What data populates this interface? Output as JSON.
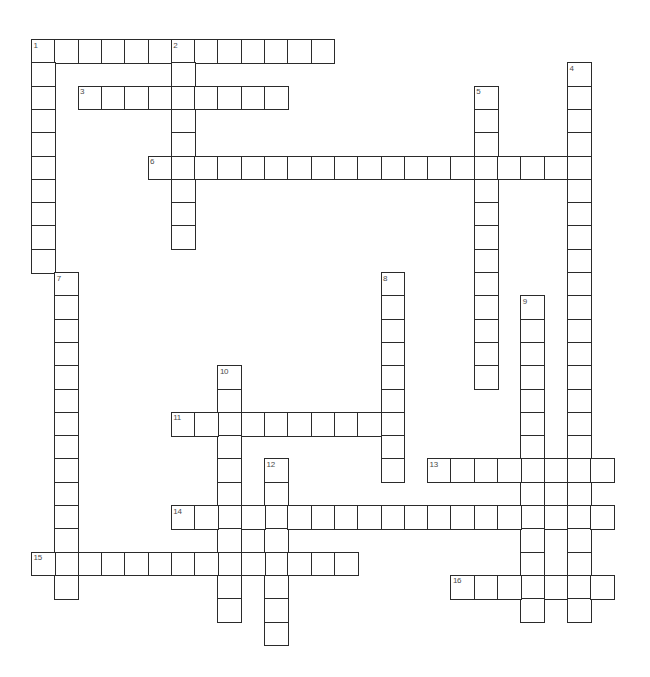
{
  "puzzle": {
    "type": "crossword-grid",
    "title": "",
    "grid_origin": {
      "x": 31,
      "y": 39
    },
    "cell_size": 23.3,
    "cell_fill": "#ffffff",
    "cell_border": "#2b2b2b",
    "number_color": "#4a4a4a",
    "background": "#ffffff",
    "entry_count": 16,
    "entries": [
      {
        "number": "1",
        "direction": "across",
        "row": 0,
        "col": 0,
        "length": 13
      },
      {
        "number": "1",
        "direction": "down",
        "row": 0,
        "col": 0,
        "length": 10
      },
      {
        "number": "2",
        "direction": "down",
        "row": 0,
        "col": 6,
        "length": 9
      },
      {
        "number": "3",
        "direction": "across",
        "row": 2,
        "col": 2,
        "length": 9
      },
      {
        "number": "4",
        "direction": "down",
        "row": 1,
        "col": 23,
        "length": 24
      },
      {
        "number": "5",
        "direction": "down",
        "row": 2,
        "col": 19,
        "length": 13
      },
      {
        "number": "6",
        "direction": "across",
        "row": 5,
        "col": 5,
        "length": 18
      },
      {
        "number": "7",
        "direction": "down",
        "row": 10,
        "col": 1,
        "length": 14
      },
      {
        "number": "8",
        "direction": "down",
        "row": 10,
        "col": 15,
        "length": 9
      },
      {
        "number": "9",
        "direction": "down",
        "row": 11,
        "col": 21,
        "length": 14
      },
      {
        "number": "10",
        "direction": "down",
        "row": 14,
        "col": 8,
        "length": 11
      },
      {
        "number": "11",
        "direction": "across",
        "row": 16,
        "col": 6,
        "length": 10
      },
      {
        "number": "12",
        "direction": "down",
        "row": 18,
        "col": 10,
        "length": 8
      },
      {
        "number": "13",
        "direction": "across",
        "row": 18,
        "col": 17,
        "length": 8
      },
      {
        "number": "14",
        "direction": "across",
        "row": 20,
        "col": 6,
        "length": 19
      },
      {
        "number": "15",
        "direction": "across",
        "row": 22,
        "col": 0,
        "length": 14
      },
      {
        "number": "16",
        "direction": "across",
        "row": 23,
        "col": 18,
        "length": 7
      }
    ],
    "numbers": [
      {
        "label": "1",
        "row": 0,
        "col": 0
      },
      {
        "label": "2",
        "row": 0,
        "col": 6
      },
      {
        "label": "3",
        "row": 2,
        "col": 2
      },
      {
        "label": "4",
        "row": 1,
        "col": 23
      },
      {
        "label": "5",
        "row": 2,
        "col": 19
      },
      {
        "label": "6",
        "row": 5,
        "col": 5
      },
      {
        "label": "7",
        "row": 10,
        "col": 1
      },
      {
        "label": "8",
        "row": 10,
        "col": 15
      },
      {
        "label": "9",
        "row": 11,
        "col": 21
      },
      {
        "label": "10",
        "row": 14,
        "col": 8
      },
      {
        "label": "11",
        "row": 16,
        "col": 6
      },
      {
        "label": "12",
        "row": 18,
        "col": 10
      },
      {
        "label": "13",
        "row": 18,
        "col": 17
      },
      {
        "label": "14",
        "row": 20,
        "col": 6
      },
      {
        "label": "15",
        "row": 22,
        "col": 0
      },
      {
        "label": "16",
        "row": 23,
        "col": 18
      }
    ]
  }
}
